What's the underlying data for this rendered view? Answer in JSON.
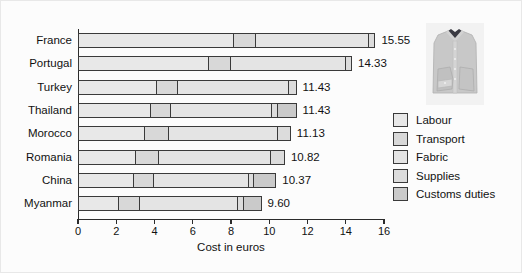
{
  "chart_data": {
    "type": "bar",
    "orientation": "horizontal",
    "stacked": true,
    "title": "",
    "xlabel": "Cost in euros",
    "ylabel": "",
    "xlim": [
      0,
      16
    ],
    "xticks": [
      0,
      2,
      4,
      6,
      8,
      10,
      12,
      14,
      16
    ],
    "xtick_labels": [
      "0",
      "2",
      "4",
      "6",
      "8",
      "10",
      "12",
      "14",
      "16"
    ],
    "grid": false,
    "legend_position": "right",
    "categories": [
      "France",
      "Portugal",
      "Turkey",
      "Thailand",
      "Morocco",
      "Romania",
      "China",
      "Myanmar"
    ],
    "totals": [
      15.55,
      14.33,
      11.43,
      11.43,
      11.13,
      10.82,
      10.37,
      9.6
    ],
    "total_labels": [
      "15.55",
      "14.33",
      "11.43",
      "11.43",
      "11.13",
      "10.82",
      "10.37",
      "9.60"
    ],
    "series": [
      {
        "name": "Labour",
        "color": "#e8e8e8",
        "values": [
          8.16,
          6.85,
          4.1,
          3.79,
          3.47,
          3.0,
          2.89,
          2.1
        ]
      },
      {
        "name": "Transport",
        "color": "#d8d8d8",
        "values": [
          1.16,
          1.16,
          1.1,
          1.05,
          1.26,
          1.21,
          1.05,
          1.1
        ]
      },
      {
        "name": "Fabric",
        "color": "#e4e4e4",
        "values": [
          5.95,
          6.05,
          5.9,
          5.35,
          5.8,
          5.95,
          5.05,
          5.2
        ]
      },
      {
        "name": "Supplies",
        "color": "#dcdcdc",
        "values": [
          0.28,
          0.27,
          0.33,
          0.29,
          0.6,
          0.66,
          0.28,
          0.3
        ]
      },
      {
        "name": "Customs duties",
        "color": "#cacaca",
        "values": [
          0.0,
          0.0,
          0.0,
          0.95,
          0.0,
          0.0,
          1.1,
          0.9
        ]
      }
    ]
  },
  "legend": {
    "items": [
      {
        "label": "Labour"
      },
      {
        "label": "Transport"
      },
      {
        "label": "Fabric"
      },
      {
        "label": "Supplies"
      },
      {
        "label": "Customs duties"
      }
    ]
  },
  "photo": {
    "alt": "folded grey dress shirt"
  }
}
